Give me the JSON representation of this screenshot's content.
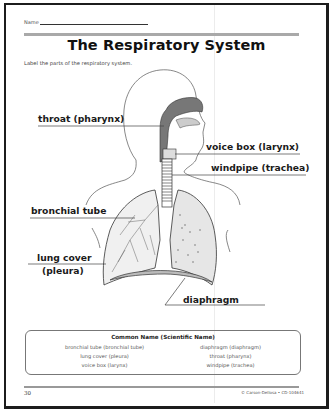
{
  "worksheet": {
    "name_label": "Name",
    "title": "The Respiratory System",
    "instructions": "Label the parts of the respiratory system.",
    "diagram": {
      "description": "Outline of a human head and torso showing the respiratory system",
      "labels": [
        {
          "id": "throat",
          "text": "throat (pharynx)"
        },
        {
          "id": "voice-box",
          "text": "voice box (larynx)"
        },
        {
          "id": "windpipe",
          "text": "windpipe (trachea)"
        },
        {
          "id": "bronchial-tube",
          "text": "bronchial tube"
        },
        {
          "id": "lung-cover-line1",
          "text": "lung cover"
        },
        {
          "id": "lung-cover-line2",
          "text": "(pleura)"
        },
        {
          "id": "diaphragm",
          "text": "diaphragm"
        }
      ]
    },
    "word_bank": {
      "title": "Common Name (Scientific Name)",
      "left_column": [
        "bronchial tube (bronchial tube)",
        "lung cover (pleura)",
        "voice box (larynx)"
      ],
      "right_column": [
        "diaphragm (diaphragm)",
        "throat (pharynx)",
        "windpipe (trachea)"
      ]
    },
    "footer": {
      "page_number": "30",
      "copyright": "© Carson-Dellosa • CD-104641"
    }
  },
  "colors": {
    "border": "#1c1c1c",
    "rule_bar": "#a9a9a9",
    "text": "#1a1a1a"
  }
}
